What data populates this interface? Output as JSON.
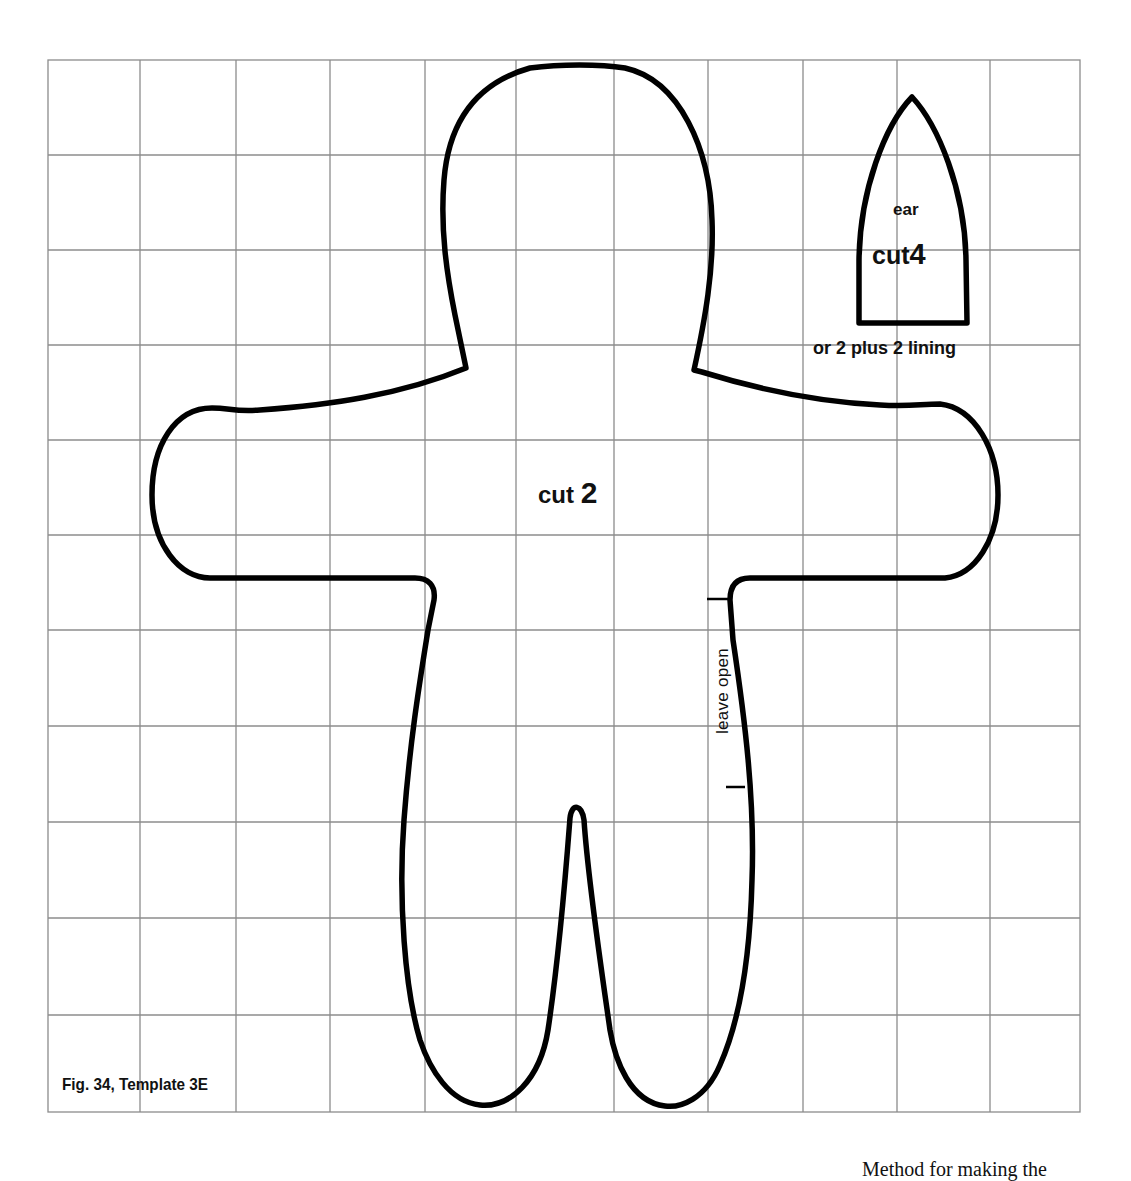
{
  "figure": {
    "caption": "Fig. 34, Template 3E",
    "grid": {
      "left": 48,
      "right": 1080,
      "top": 60,
      "bottom": 1112,
      "columns": 11,
      "rows": 11,
      "line_color": "#8c8c8c"
    },
    "outline_color": "#000000",
    "body_piece": {
      "name": "doll body",
      "cut_label": "cut",
      "cut_count": "2",
      "opening_label": "leave open"
    },
    "ear_piece": {
      "name_label": "ear",
      "cut_label": "cut",
      "cut_count": "4",
      "alt_instruction": "or 2 plus 2 lining"
    }
  },
  "footer_fragment": "Method for making the"
}
